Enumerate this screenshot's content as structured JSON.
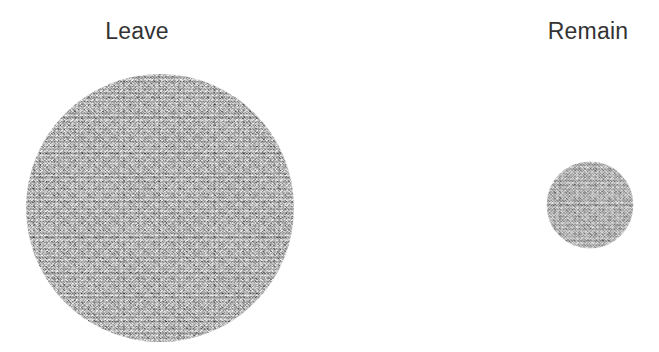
{
  "figure": {
    "background_color": "#ffffff",
    "width": 659,
    "height": 352,
    "label_color": "#333333",
    "bubble_color": "#a9a9a9"
  },
  "labels": {
    "leave": "Leave",
    "remain": "Remain"
  },
  "chart_data": {
    "type": "bubble",
    "title": "",
    "subtitle": "",
    "xlabel": "",
    "ylabel": "",
    "grid": false,
    "legend": "none",
    "encoding": "area-proportional circles",
    "categories": [
      "Leave",
      "Remain"
    ],
    "diameters_px": [
      268,
      87
    ],
    "radii_px": [
      134,
      43.5
    ],
    "centers_px": [
      [
        160,
        208
      ],
      [
        590,
        205
      ]
    ],
    "label_positions_px": [
      [
        137,
        31
      ],
      [
        588,
        31
      ]
    ],
    "area_ratio_leave_to_remain": 9.5,
    "values": [
      9.5,
      1.0
    ],
    "annotations": [
      {
        "text": "Leave",
        "x": 137,
        "y": 31
      },
      {
        "text": "Remain",
        "x": 588,
        "y": 31
      }
    ]
  }
}
